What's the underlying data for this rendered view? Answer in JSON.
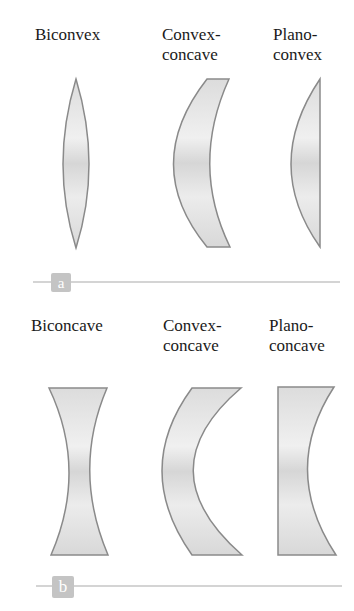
{
  "panels": [
    {
      "tag": "a",
      "lenses": [
        {
          "name": "biconvex",
          "title_lines": [
            "Biconvex"
          ]
        },
        {
          "name": "convex-concave",
          "title_lines": [
            "Convex-",
            "concave"
          ]
        },
        {
          "name": "plano-convex",
          "title_lines": [
            "Plano-",
            "convex"
          ]
        }
      ]
    },
    {
      "tag": "b",
      "lenses": [
        {
          "name": "biconcave",
          "title_lines": [
            "Biconcave"
          ]
        },
        {
          "name": "convex-concave",
          "title_lines": [
            "Convex-",
            "concave"
          ]
        },
        {
          "name": "plano-concave",
          "title_lines": [
            "Plano-",
            "concave"
          ]
        }
      ]
    }
  ],
  "colors": {
    "lens_fill": "#e2e2e2",
    "lens_stroke": "#8a8a8a",
    "tag_bg": "#c4c4c4",
    "divider": "#d4d4d4"
  }
}
